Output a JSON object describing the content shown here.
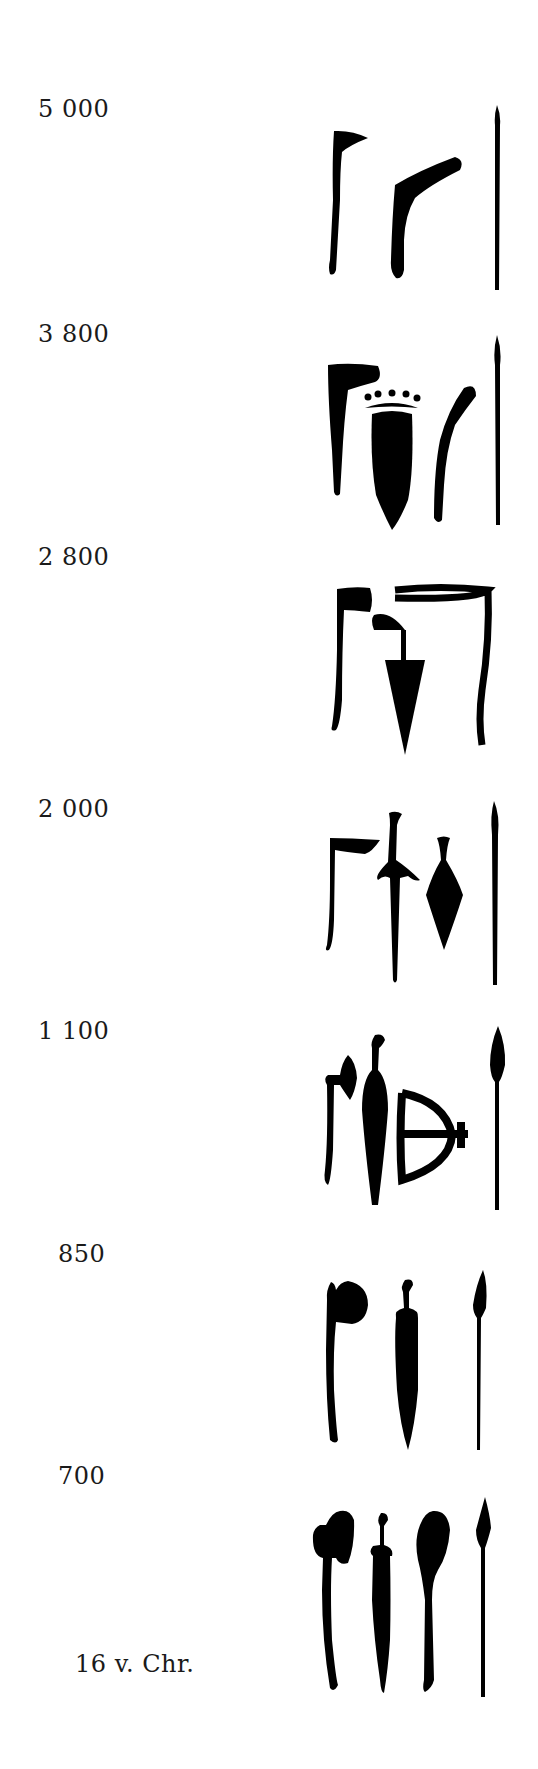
{
  "periods": [
    {
      "label": "5 000",
      "weapons": [
        "axe",
        "boomerang-club",
        "spear"
      ]
    },
    {
      "label": "3 800",
      "weapons": [
        "axe",
        "mace-dagger",
        "boomerang-club",
        "spear"
      ]
    },
    {
      "label": "2 800",
      "weapons": [
        "axe",
        "triangular-dagger",
        "bow"
      ]
    },
    {
      "label": "2 000",
      "weapons": [
        "axe",
        "sword",
        "dagger",
        "spear"
      ]
    },
    {
      "label": "1 100",
      "weapons": [
        "battle-axe",
        "sword",
        "bow-and-arrow",
        "spear"
      ]
    },
    {
      "label": "850",
      "weapons": [
        "axe",
        "sword",
        "spear"
      ]
    },
    {
      "label": "700",
      "weapons": [
        "axe",
        "sword",
        "mace",
        "spear"
      ]
    }
  ],
  "footer": {
    "label": "16 v. Chr."
  }
}
